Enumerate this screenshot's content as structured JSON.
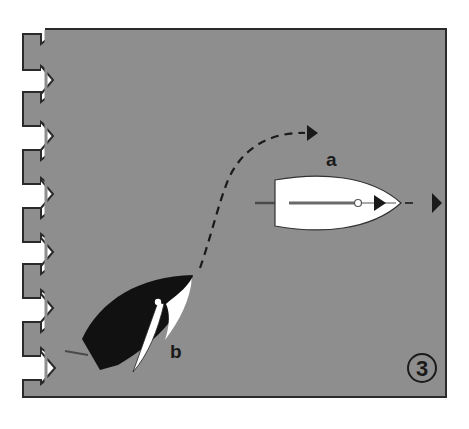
{
  "figure": {
    "number": "3",
    "background_color": "#8e8e8e",
    "border_color": "#2a2a2a",
    "boats": [
      {
        "id": "a",
        "label": "a",
        "hull_color": "#ffffff",
        "description": "white boat sailing downwind to the right"
      },
      {
        "id": "b",
        "label": "b",
        "hull_color": "#111111",
        "description": "black boat heading up to the right"
      }
    ],
    "paths": [
      {
        "from": "b",
        "description": "dashed course curving up and to the right ending in arrowhead"
      },
      {
        "from": "a",
        "description": "dashed course continuing straight to the right ending in arrowhead"
      }
    ],
    "wind_arrows": {
      "count": 7,
      "direction": "right",
      "color": "#ffffff"
    }
  }
}
